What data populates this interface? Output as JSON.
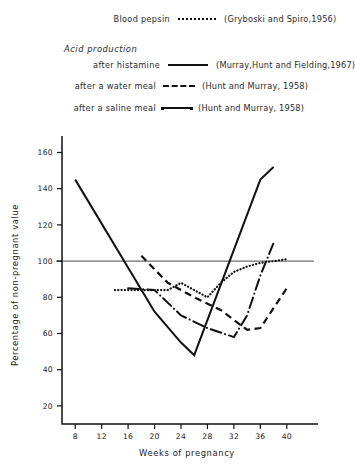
{
  "legend": {
    "group_header": "Acid production",
    "rows": [
      {
        "label": "Blood pepsin",
        "sample": "dotted",
        "citation": "(Gryboski and Spiro,1956)"
      },
      {
        "label": "after histamine",
        "sample": "solid",
        "citation": "(Murray,Hunt and Fielding,1967)"
      },
      {
        "label": "after a water meal",
        "sample": "dashed",
        "citation": "(Hunt and Murray, 1958)"
      },
      {
        "label": "after a saline meal",
        "sample": "dash-dot",
        "citation": "(Hunt and Murray, 1958)"
      }
    ]
  },
  "chart_data": {
    "type": "line",
    "title": "",
    "xlabel": "Weeks of pregnancy",
    "ylabel": "Percentage of non-pregnant value",
    "xlim": [
      6,
      42
    ],
    "ylim": [
      10,
      168
    ],
    "xticks": [
      8,
      12,
      16,
      20,
      24,
      28,
      32,
      36,
      40
    ],
    "yticks": [
      20,
      40,
      60,
      80,
      100,
      120,
      140,
      160
    ],
    "grid": false,
    "legend_position": "above-plot",
    "reference_line": {
      "value": 100,
      "orientation": "horizontal",
      "label": "non-pregnant value"
    },
    "series": [
      {
        "name": "Blood pepsin",
        "style": "dotted",
        "citation": "(Gryboski and Spiro,1956)",
        "x": [
          14,
          18,
          22,
          24,
          26,
          28,
          30,
          32,
          34,
          36,
          38,
          40
        ],
        "y": [
          84,
          84,
          84,
          88,
          84,
          80,
          88,
          94,
          97,
          99,
          100,
          101
        ]
      },
      {
        "name": "Acid production after histamine",
        "style": "solid",
        "citation": "(Murray,Hunt and Fielding,1967)",
        "x": [
          8,
          20,
          24,
          26,
          36,
          38
        ],
        "y": [
          145,
          72,
          55,
          48,
          145,
          152
        ]
      },
      {
        "name": "Acid production after a water meal",
        "style": "dashed",
        "citation": "(Hunt and Murray, 1958)",
        "x": [
          18,
          22,
          26,
          30,
          34,
          36,
          40
        ],
        "y": [
          103,
          88,
          80,
          73,
          62,
          63,
          85
        ]
      },
      {
        "name": "Acid production after a saline meal",
        "style": "dash-dot",
        "citation": "(Hunt and Murray, 1958)",
        "x": [
          16,
          20,
          24,
          28,
          32,
          34,
          36,
          38
        ],
        "y": [
          85,
          84,
          70,
          63,
          58,
          70,
          92,
          110
        ]
      }
    ]
  }
}
